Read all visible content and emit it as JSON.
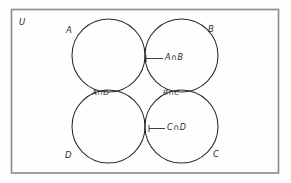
{
  "diagram": {
    "type": "venn-four-set",
    "universe_label": "U",
    "sets": [
      {
        "id": "A",
        "label": "A",
        "position": "top-left"
      },
      {
        "id": "B",
        "label": "B",
        "position": "top-right"
      },
      {
        "id": "C",
        "label": "C",
        "position": "bottom-right"
      },
      {
        "id": "D",
        "label": "D",
        "position": "bottom-left"
      }
    ],
    "intersections": [
      {
        "id": "AB",
        "label": "A∩B",
        "between": "A and B",
        "callout": true
      },
      {
        "id": "AD",
        "label": "A∩D",
        "between": "A and D",
        "callout": false
      },
      {
        "id": "BC",
        "label": "B∩C",
        "between": "B and C",
        "callout": false
      },
      {
        "id": "CD",
        "label": "C∩D",
        "between": "C and D",
        "callout": true
      }
    ],
    "colors": {
      "background": "#fefefe",
      "frame_stroke": "#8a8a8a",
      "circle_stroke": "#2b2b2b",
      "text": "#2b2b2b"
    }
  }
}
